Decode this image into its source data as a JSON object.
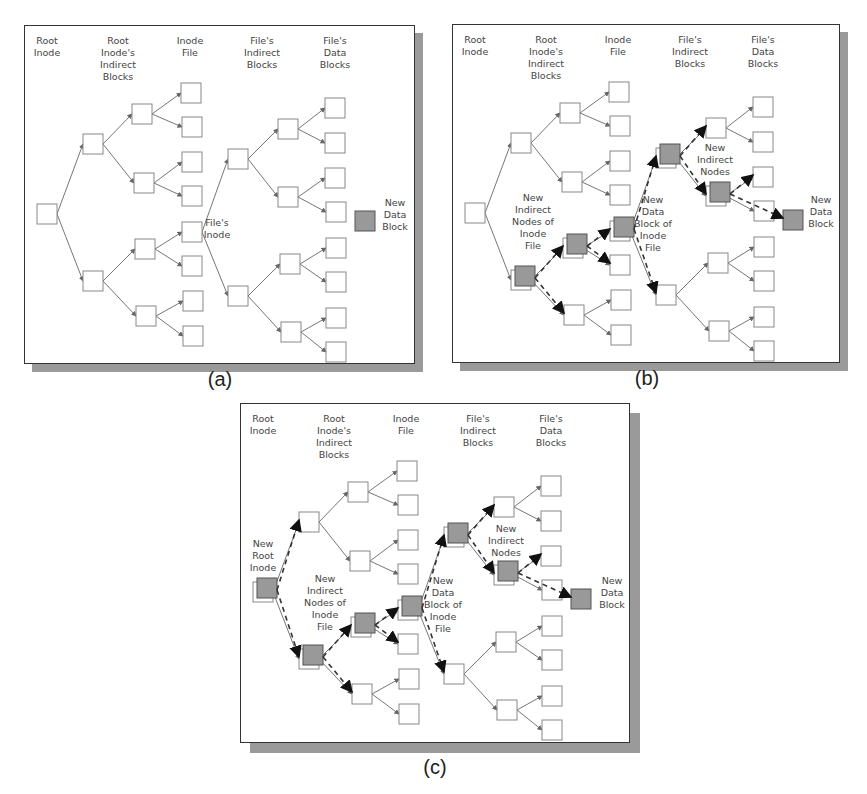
{
  "figure": {
    "colors": {
      "box_fill": "#ffffff",
      "box_stroke": "#888888",
      "new_fill": "#999999",
      "edge": "#666666",
      "new_edge": "#333333",
      "shadow": "#9a9a9a"
    }
  },
  "column_headers": [
    {
      "id": "root",
      "lines": [
        "Root",
        "Inode"
      ],
      "x": 22
    },
    {
      "id": "root_ind",
      "lines": [
        "Root",
        "Inode's",
        "Indirect",
        "Blocks"
      ],
      "x": 93
    },
    {
      "id": "inode_file",
      "lines": [
        "Inode",
        "File"
      ],
      "x": 165
    },
    {
      "id": "file_ind",
      "lines": [
        "File's",
        "Indirect",
        "Blocks"
      ],
      "x": 237
    },
    {
      "id": "file_data",
      "lines": [
        "File's",
        "Data",
        "Blocks"
      ],
      "x": 310
    }
  ],
  "nodes": {
    "R": [
      12,
      178
    ],
    "A1": [
      58,
      108
    ],
    "A2": [
      58,
      245
    ],
    "B1": [
      107,
      78
    ],
    "B2": [
      109,
      147
    ],
    "B3": [
      110,
      213
    ],
    "B4": [
      111,
      280
    ],
    "C1": [
      156,
      57
    ],
    "C2": [
      157,
      91
    ],
    "C3": [
      157,
      126
    ],
    "C4": [
      157,
      160
    ],
    "C5": [
      157,
      196
    ],
    "C6": [
      157,
      230
    ],
    "C7": [
      158,
      265
    ],
    "C8": [
      158,
      300
    ],
    "D1": [
      203,
      123
    ],
    "D2": [
      203,
      260
    ],
    "E1": [
      253,
      93
    ],
    "E2": [
      253,
      161
    ],
    "E3": [
      255,
      228
    ],
    "E4": [
      256,
      296
    ],
    "F1": [
      300,
      72
    ],
    "F2": [
      300,
      107
    ],
    "F3": [
      300,
      142
    ],
    "F4": [
      301,
      176
    ],
    "F5": [
      301,
      212
    ],
    "F6": [
      301,
      246
    ],
    "F7": [
      301,
      282
    ],
    "F8": [
      301,
      316
    ],
    "N": [
      330,
      185
    ]
  },
  "edges": [
    [
      "R",
      "A1"
    ],
    [
      "R",
      "A2"
    ],
    [
      "A1",
      "B1"
    ],
    [
      "A1",
      "B2"
    ],
    [
      "A2",
      "B3"
    ],
    [
      "A2",
      "B4"
    ],
    [
      "B1",
      "C1"
    ],
    [
      "B1",
      "C2"
    ],
    [
      "B2",
      "C3"
    ],
    [
      "B2",
      "C4"
    ],
    [
      "B3",
      "C5"
    ],
    [
      "B3",
      "C6"
    ],
    [
      "B4",
      "C7"
    ],
    [
      "B4",
      "C8"
    ],
    [
      "C5",
      "D1"
    ],
    [
      "C5",
      "D2"
    ],
    [
      "D1",
      "E1"
    ],
    [
      "D1",
      "E2"
    ],
    [
      "D2",
      "E3"
    ],
    [
      "D2",
      "E4"
    ],
    [
      "E1",
      "F1"
    ],
    [
      "E1",
      "F2"
    ],
    [
      "E2",
      "F3"
    ],
    [
      "E2",
      "F4"
    ],
    [
      "E3",
      "F5"
    ],
    [
      "E3",
      "F6"
    ],
    [
      "E4",
      "F7"
    ],
    [
      "E4",
      "F8"
    ]
  ],
  "panels": [
    {
      "id": "a",
      "caption": "(a)",
      "frame": {
        "x": 24,
        "y": 25,
        "w": 391,
        "h": 339
      },
      "new_nodes": [
        "N"
      ],
      "new_edges": [],
      "labels": [
        {
          "lines": [
            "File's",
            "Inode"
          ],
          "x": 192,
          "y": 200
        },
        {
          "lines": [
            "New",
            "Data",
            "Block"
          ],
          "x": 370,
          "y": 180
        }
      ]
    },
    {
      "id": "b",
      "caption": "(b)",
      "frame": {
        "x": 452,
        "y": 24,
        "w": 388,
        "h": 339
      },
      "new_nodes": [
        "A2",
        "B3",
        "C5",
        "D1",
        "E2",
        "N"
      ],
      "new_edges": [
        [
          "A2",
          "B3"
        ],
        [
          "A2",
          "B4"
        ],
        [
          "B3",
          "C5"
        ],
        [
          "B3",
          "C6"
        ],
        [
          "C5",
          "D1"
        ],
        [
          "C5",
          "D2"
        ],
        [
          "D1",
          "E1"
        ],
        [
          "D1",
          "E2"
        ],
        [
          "E2",
          "F3"
        ],
        [
          "E2",
          "N"
        ]
      ],
      "labels": [
        {
          "lines": [
            "New",
            "Indirect",
            "Nodes of",
            "Inode",
            "File"
          ],
          "x": 80,
          "y": 176
        },
        {
          "lines": [
            "New",
            "Data",
            "Block of",
            "Inode",
            "File"
          ],
          "x": 200,
          "y": 178
        },
        {
          "lines": [
            "New",
            "Indirect",
            "Nodes"
          ],
          "x": 262,
          "y": 126
        },
        {
          "lines": [
            "New",
            "Data",
            "Block"
          ],
          "x": 368,
          "y": 178
        }
      ]
    },
    {
      "id": "c",
      "caption": "(c)",
      "frame": {
        "x": 240,
        "y": 403,
        "w": 390,
        "h": 340
      },
      "new_nodes": [
        "R",
        "A2",
        "B3",
        "C5",
        "D1",
        "E2",
        "N"
      ],
      "new_edges": [
        [
          "R",
          "A1"
        ],
        [
          "R",
          "A2"
        ],
        [
          "A2",
          "B3"
        ],
        [
          "A2",
          "B4"
        ],
        [
          "B3",
          "C5"
        ],
        [
          "B3",
          "C6"
        ],
        [
          "C5",
          "D1"
        ],
        [
          "C5",
          "D2"
        ],
        [
          "D1",
          "E1"
        ],
        [
          "D1",
          "E2"
        ],
        [
          "E2",
          "F3"
        ],
        [
          "E2",
          "N"
        ]
      ],
      "labels": [
        {
          "lines": [
            "New",
            "Root",
            "Inode"
          ],
          "x": 22,
          "y": 143
        },
        {
          "lines": [
            "New",
            "Indirect",
            "Nodes of",
            "Inode",
            "File"
          ],
          "x": 84,
          "y": 178
        },
        {
          "lines": [
            "New",
            "Data",
            "Block of",
            "Inode",
            "File"
          ],
          "x": 202,
          "y": 180
        },
        {
          "lines": [
            "New",
            "Indirect",
            "Nodes"
          ],
          "x": 265,
          "y": 128
        },
        {
          "lines": [
            "New",
            "Data",
            "Block"
          ],
          "x": 371,
          "y": 180
        }
      ]
    }
  ]
}
